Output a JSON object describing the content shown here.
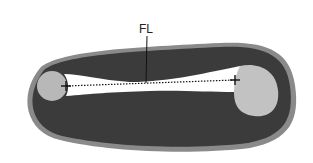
{
  "diagram": {
    "label": "FL",
    "colors": {
      "background": "#ffffff",
      "outer_rim": "#8a8a8a",
      "body": "#3b3b3b",
      "bone_shaft": "#ffffff",
      "epiphysis": "#b8b8b8",
      "measure_line": "#111111"
    },
    "parts": [
      "outer-rim",
      "soft-tissue",
      "femur-shaft",
      "left-epiphysis",
      "right-epiphysis",
      "measurement-line",
      "left-caliper",
      "right-caliper",
      "leader-line"
    ]
  }
}
